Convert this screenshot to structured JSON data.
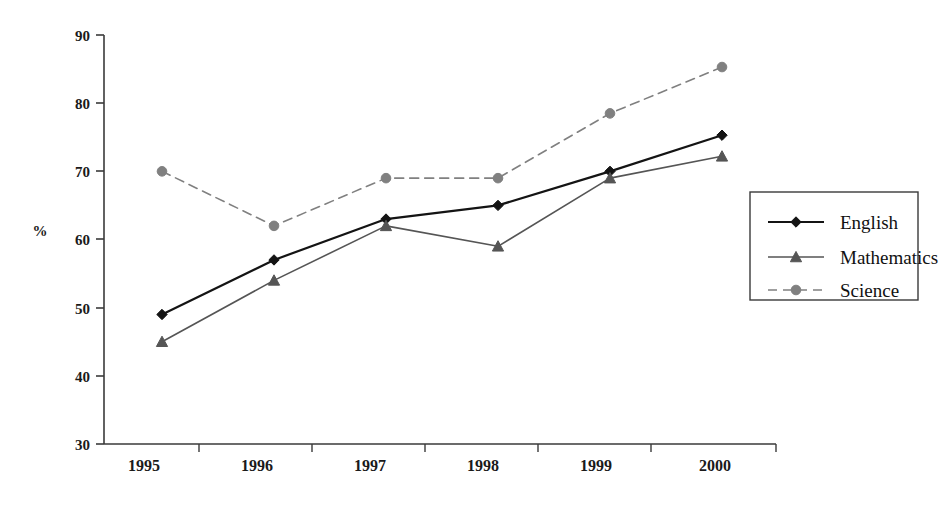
{
  "chart_data": {
    "type": "line",
    "title": "",
    "subtitle": "",
    "xlabel": "",
    "ylabel": "%",
    "categories": [
      "1995",
      "1996",
      "1997",
      "1998",
      "1999",
      "2000"
    ],
    "x": [
      1995,
      1996,
      1997,
      1998,
      1999,
      2000
    ],
    "ylim": [
      30,
      90
    ],
    "yticks": [
      30,
      40,
      50,
      60,
      70,
      80,
      90
    ],
    "ytick_labels": [
      "30",
      "40",
      "50",
      "60",
      "70",
      "80",
      "90"
    ],
    "grid": false,
    "legend_position": "right",
    "series": [
      {
        "name": "English",
        "values": [
          49,
          57,
          63,
          65,
          70,
          75.3
        ],
        "color": "#141414",
        "marker": "diamond",
        "line_style": "solid",
        "line_width": 2.2
      },
      {
        "name": "Mathematics",
        "values": [
          45,
          54,
          62,
          59,
          69,
          72.2
        ],
        "color": "#555555",
        "marker": "triangle",
        "line_style": "solid",
        "line_width": 1.6
      },
      {
        "name": "Science",
        "values": [
          70,
          62,
          69,
          69,
          78.5,
          85.3
        ],
        "color": "#808080",
        "marker": "circle",
        "line_style": "dashed",
        "line_width": 1.6
      }
    ]
  },
  "axes": {
    "y_title": "%",
    "y_tick_labels": [
      "90",
      "80",
      "70",
      "60",
      "50",
      "40",
      "30"
    ],
    "x_tick_labels": [
      "1995",
      "1996",
      "1997",
      "1998",
      "1999",
      "2000"
    ]
  },
  "legend": {
    "items": [
      {
        "label": "English",
        "marker": "diamond-marker",
        "style": "solid"
      },
      {
        "label": "Mathematics",
        "marker": "triangle-marker",
        "style": "solid"
      },
      {
        "label": "Science",
        "marker": "circle-marker",
        "style": "dashed"
      }
    ]
  },
  "colors": {
    "english": "#141414",
    "mathematics": "#555555",
    "science": "#808080",
    "axis": "#3a3a3a",
    "background": "#ffffff"
  }
}
